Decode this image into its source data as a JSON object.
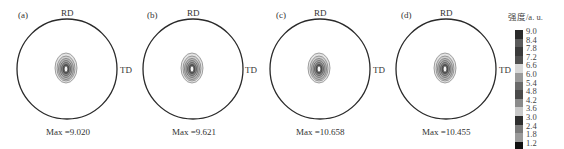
{
  "chart_data": {
    "type": "heatmap",
    "subtype": "pole-figure",
    "title": "",
    "panels": [
      {
        "label": "(a)",
        "top_label": "RD",
        "side_label": "TD",
        "max_text": "Max =9.020",
        "max": 9.02
      },
      {
        "label": "(b)",
        "top_label": "RD",
        "side_label": "TD",
        "max_text": "Max =9.621",
        "max": 9.621
      },
      {
        "label": "(c)",
        "top_label": "RD",
        "side_label": "TD",
        "max_text": "Max =10.658",
        "max": 10.658
      },
      {
        "label": "(d)",
        "top_label": "RD",
        "side_label": "TD",
        "max_text": "Max =10.455",
        "max": 10.455
      }
    ],
    "colorbar": {
      "title": "强度/a. u.",
      "levels": [
        "9.0",
        "8.4",
        "7.8",
        "7.2",
        "6.6",
        "6.0",
        "5.4",
        "4.8",
        "4.2",
        "3.6",
        "3.0",
        "2.4",
        "1.8",
        "1.2"
      ],
      "colors": [
        "#2a2a2a",
        "#5a5a5a",
        "#3a3a3a",
        "#505050",
        "#d8d8d8",
        "#9a9a9a",
        "#6a6a6a",
        "#4a4a4a",
        "#8a8a8a",
        "#c8c8c8",
        "#2e2e2e",
        "#7a7a7a",
        "#9a9a9a",
        "#111111"
      ]
    }
  },
  "panels": [
    {
      "label": "(a)",
      "rd": "RD",
      "td": "TD",
      "max": "Max =9.020"
    },
    {
      "label": "(b)",
      "rd": "RD",
      "td": "TD",
      "max": "Max =9.621"
    },
    {
      "label": "(c)",
      "rd": "RD",
      "td": "TD",
      "max": "Max =10.658"
    },
    {
      "label": "(d)",
      "rd": "RD",
      "td": "TD",
      "max": "Max =10.455"
    }
  ],
  "legend": {
    "title": "强度/a. u.",
    "labels": [
      "9.0",
      "8.4",
      "7.8",
      "7.2",
      "6.6",
      "6.0",
      "5.4",
      "4.8",
      "4.2",
      "3.6",
      "3.0",
      "2.4",
      "1.8",
      "1.2"
    ],
    "colors": [
      "#2a2a2a",
      "#5a5a5a",
      "#3a3a3a",
      "#505050",
      "#d8d8d8",
      "#9a9a9a",
      "#6a6a6a",
      "#4a4a4a",
      "#8a8a8a",
      "#c8c8c8",
      "#2e2e2e",
      "#7a7a7a",
      "#9a9a9a",
      "#111111"
    ]
  }
}
